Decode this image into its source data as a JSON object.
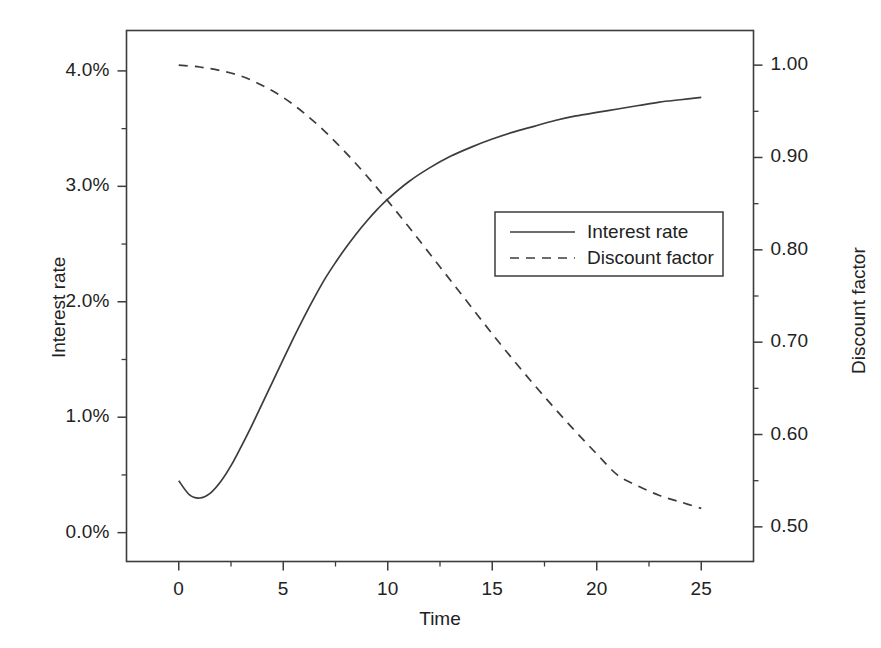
{
  "chart_data": {
    "type": "line",
    "title": "",
    "xlabel": "Time",
    "ylabel": "Interest rate",
    "y2label": "Discount factor",
    "xlim": [
      -2.5,
      27.5
    ],
    "ylim": [
      -0.25,
      4.35
    ],
    "y2lim": [
      0.4625,
      1.0375
    ],
    "grid": false,
    "legend_position": "center-right inside axes",
    "xticks": [
      0,
      5,
      10,
      15,
      20,
      25
    ],
    "xtick_labels": [
      "0",
      "5",
      "10",
      "15",
      "20",
      "25"
    ],
    "xminor_ticks": [
      2.5,
      7.5,
      12.5,
      17.5,
      22.5
    ],
    "yticks": [
      0.0,
      1.0,
      2.0,
      3.0,
      4.0
    ],
    "ytick_labels": [
      "0.0%",
      "1.0%",
      "2.0%",
      "3.0%",
      "4.0%"
    ],
    "yminor_ticks": [
      0.5,
      1.5,
      2.5,
      3.5
    ],
    "y2ticks": [
      0.5,
      0.6,
      0.7,
      0.8,
      0.9,
      1.0
    ],
    "y2tick_labels": [
      "0.50",
      "0.60",
      "0.70",
      "0.80",
      "0.90",
      "1.00"
    ],
    "y2minor_ticks": [
      0.55,
      0.65,
      0.75,
      0.85,
      0.95
    ],
    "series": [
      {
        "name": "Interest rate",
        "axis": "left",
        "style": "solid",
        "color": "#3c3c3c",
        "units": "percent",
        "x": [
          0,
          0.5,
          1,
          1.5,
          2,
          2.5,
          3,
          3.5,
          4,
          4.5,
          5,
          5.5,
          6,
          6.5,
          7,
          7.5,
          8,
          8.5,
          9,
          9.5,
          10,
          11,
          12,
          13,
          14,
          15,
          16,
          17,
          18,
          19,
          20,
          21,
          22,
          23,
          24,
          25
        ],
        "values": [
          0.45,
          0.33,
          0.3,
          0.34,
          0.44,
          0.58,
          0.75,
          0.93,
          1.12,
          1.31,
          1.5,
          1.69,
          1.87,
          2.04,
          2.2,
          2.34,
          2.47,
          2.59,
          2.7,
          2.8,
          2.89,
          3.04,
          3.16,
          3.26,
          3.34,
          3.41,
          3.47,
          3.52,
          3.57,
          3.61,
          3.64,
          3.67,
          3.7,
          3.73,
          3.75,
          3.77
        ]
      },
      {
        "name": "Discount factor",
        "axis": "right",
        "style": "dashed",
        "color": "#3c3c3c",
        "units": "factor",
        "x": [
          0,
          1,
          2,
          3,
          4,
          5,
          6,
          7,
          8,
          9,
          10,
          11,
          12,
          13,
          14,
          15,
          16,
          17,
          18,
          19,
          20,
          21,
          22,
          23,
          24,
          25
        ],
        "values": [
          1.0,
          0.998,
          0.994,
          0.988,
          0.978,
          0.965,
          0.948,
          0.928,
          0.905,
          0.88,
          0.853,
          0.825,
          0.796,
          0.767,
          0.738,
          0.709,
          0.681,
          0.654,
          0.628,
          0.603,
          0.579,
          0.556,
          0.544,
          0.534,
          0.527,
          0.52
        ]
      }
    ],
    "legend": [
      {
        "label": "Interest rate",
        "style": "solid"
      },
      {
        "label": "Discount factor",
        "style": "dashed"
      }
    ],
    "colors": {
      "axis": "#3c3c3c",
      "line": "#3c3c3c",
      "background": "#ffffff",
      "text": "#222222"
    }
  }
}
